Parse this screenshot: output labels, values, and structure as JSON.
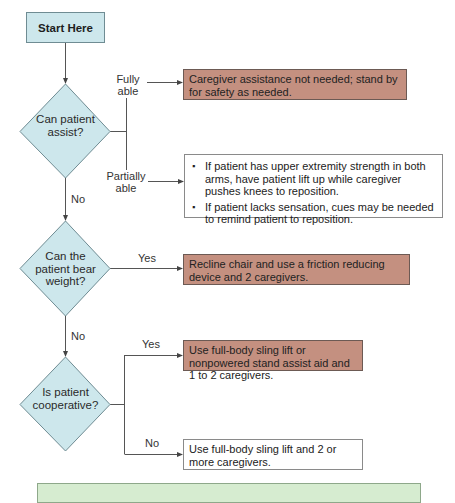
{
  "flowchart": {
    "start": {
      "label": "Start Here"
    },
    "decisions": [
      {
        "id": "can-patient-assist",
        "label": "Can patient assist?"
      },
      {
        "id": "can-patient-bear-weight",
        "label": "Can the patient bear weight?"
      },
      {
        "id": "is-patient-cooperative",
        "label": "Is patient cooperative?"
      }
    ],
    "edge_labels": {
      "fully_able": "Fully able",
      "partially_able": "Partially able",
      "no_1": "No",
      "yes_2": "Yes",
      "no_2": "No",
      "yes_3": "Yes",
      "no_3": "No"
    },
    "outcomes": {
      "fully_able": "Caregiver assistance not needed; stand by for safety as needed.",
      "partially_able": [
        "If patient has upper extremity strength in both arms, have patient lift up while caregiver pushes knees to reposition.",
        "If patient lacks sensation, cues may be needed to remind patient to reposition."
      ],
      "bear_weight_yes": "Recline chair and use a friction reducing device and 2 caregivers.",
      "cooperative_yes": "Use full-body sling lift or nonpowered stand assist aid and 1 to 2 caregivers.",
      "cooperative_no": "Use full-body sling lift and 2 or more caregivers."
    },
    "colors": {
      "start_decision_fill": "#cde7ec",
      "action_fill": "#c49080",
      "note_fill": "#ffffff",
      "footer_fill": "#d6ecd0",
      "line": "#555555"
    }
  }
}
